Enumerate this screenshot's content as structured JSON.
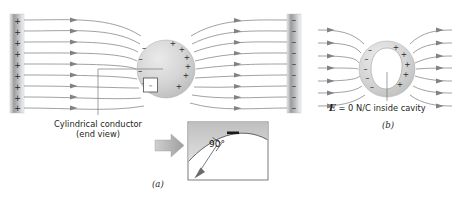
{
  "figure": {
    "panels": [
      {
        "id": "a",
        "label": "(a)",
        "left_plate": {
          "charge_symbol": "+",
          "count": 9,
          "polarity": "positive"
        },
        "right_plate": {
          "charge_symbol": "–",
          "count": 9,
          "polarity": "negative"
        },
        "conductor": {
          "caption_line1": "Cylindrical conductor",
          "caption_line2": "(end view)",
          "left_face_symbol": "–",
          "left_face_count": 4,
          "right_face_symbol": "+",
          "right_face_count": 6
        },
        "detail_inset": {
          "angle_label": "90°",
          "surface_symbol": "–"
        },
        "field_line_count": 9,
        "field_direction": "left-to-right"
      },
      {
        "id": "b",
        "label": "(b)",
        "caption_prefix": "E",
        "caption_rest": " = 0 N/C inside cavity",
        "conductor": {
          "left_face_symbol": "–",
          "left_face_count": 5,
          "right_face_symbol": "+",
          "right_face_count": 5,
          "cavity": "empty"
        },
        "field_line_count": 7,
        "field_direction": "left-to-right"
      }
    ],
    "colors": {
      "line": "#808285",
      "text": "#231f20",
      "plate_dark": "#8a8c8e",
      "plate_light": "#f2f2f2",
      "conductor_fill": "#d9d9d9",
      "inset_fill": "#ffffff",
      "inset_surface": "#c9c9c9",
      "arrow_gray": "#b3b3b3"
    }
  }
}
